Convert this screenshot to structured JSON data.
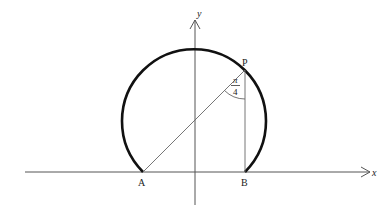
{
  "diagram": {
    "type": "geometry",
    "axes": {
      "x_label": "x",
      "y_label": "y"
    },
    "points": {
      "A": {
        "label": "A"
      },
      "B": {
        "label": "B"
      },
      "P": {
        "label": "P"
      }
    },
    "angle_label": {
      "numerator": "π",
      "denominator": "4"
    },
    "colors": {
      "arc": "#111111",
      "axis": "#444444",
      "line": "#555555"
    }
  }
}
